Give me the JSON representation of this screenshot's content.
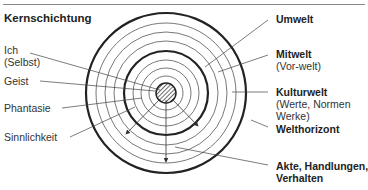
{
  "title": "Kernschichtung",
  "left_labels": [
    {
      "line1": "Ich",
      "line2": "(Selbst)"
    },
    {
      "line1": "Geist"
    },
    {
      "line1": "Phantasie"
    },
    {
      "line1": "Sinnlichkeit"
    }
  ],
  "right_labels": [
    {
      "line1": "Umwelt"
    },
    {
      "line1": "Mitwelt",
      "line2": "(Vor-welt)"
    },
    {
      "line1": "Kulturwelt",
      "line2": "(Werte, Normen",
      "line3": "Werke)"
    },
    {
      "line1": "Welthorizont"
    },
    {
      "line1": "Akte, Handlungen,",
      "line2": "Verhalten"
    }
  ]
}
